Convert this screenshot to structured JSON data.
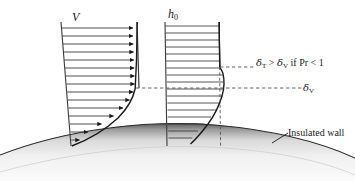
{
  "figure": {
    "labels": {
      "velocity_symbol": "V",
      "enthalpy_symbol_base": "h",
      "enthalpy_symbol_sub": "0",
      "delta_thermal_relation": "δ",
      "delta_thermal_sub": "T",
      "delta_thermal_compare": " > ",
      "delta_viscous_inline": "δ",
      "delta_viscous_inline_sub": "V",
      "prandtl_condition": " if Pr < 1",
      "delta_viscous_symbol": "δ",
      "delta_viscous_sub": "V",
      "wall_label": "Insulated wall"
    },
    "colors": {
      "line": "#1a1a1a",
      "profile_line": "#3a3a3a",
      "dashed": "#555555",
      "wall_dark": "#4a4a4a",
      "wall_light": "#f2f2f2",
      "background": "#ffffff"
    },
    "velocity_profile": {
      "description": "Velocity boundary layer with arrow vectors",
      "arrow_count": 13,
      "arrow_rows_y": [
        28,
        35,
        42,
        49,
        56,
        63,
        70,
        77,
        84,
        91,
        98,
        105,
        112,
        119,
        126,
        133
      ],
      "tail_x_top": 62,
      "tail_x_bottom": 72,
      "freestream_x": 138
    },
    "thermal_profile": {
      "description": "Total enthalpy profile with overshoot bulge",
      "line_count": 16,
      "tail_x": 166,
      "freestream_x": 222
    },
    "boundary_layers": {
      "delta_thermal_y": 67,
      "delta_viscous_y": 88
    }
  }
}
